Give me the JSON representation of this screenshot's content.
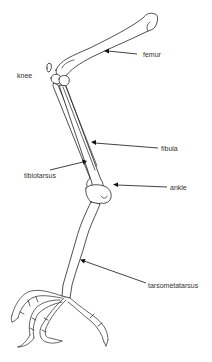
{
  "diagram": {
    "labels": [
      {
        "id": "femur",
        "text": "femur"
      },
      {
        "id": "knee",
        "text": "knee"
      },
      {
        "id": "fibula",
        "text": "fibula"
      },
      {
        "id": "tibiotarsus",
        "text": "tibiotarsus"
      },
      {
        "id": "ankle",
        "text": "ankle"
      },
      {
        "id": "tarsometatarsus",
        "text": "tarsometatarsus"
      }
    ],
    "colors": {
      "line": "#222222",
      "text": "#333333",
      "background": "#ffffff"
    }
  }
}
